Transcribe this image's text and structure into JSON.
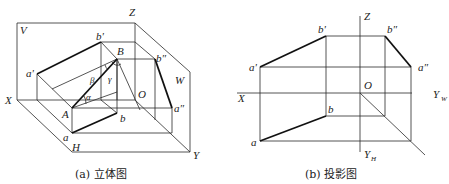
{
  "figure_a": {
    "caption": "(a) 立体图",
    "labels": {
      "V": "V",
      "H": "H",
      "W": "W",
      "X": "X",
      "Y": "Y",
      "Z": "Z",
      "O": "O",
      "a_prime": "a'",
      "b_prime": "b'",
      "B": "B",
      "b_dprime": "b″",
      "a_dprime": "a″",
      "A": "A",
      "a": "a",
      "b": "b",
      "alpha": "α",
      "beta": "β",
      "gamma": "γ"
    }
  },
  "figure_b": {
    "caption": "(b) 投影图",
    "labels": {
      "X": "X",
      "Z": "Z",
      "O": "O",
      "Y_W_main": "Y",
      "Y_W_sub": "W",
      "Y_H_main": "Y",
      "Y_H_sub": "H",
      "a_prime": "a'",
      "b_prime": "b'",
      "b_dprime": "b″",
      "a_dprime": "a″",
      "a": "a",
      "b": "b"
    }
  }
}
